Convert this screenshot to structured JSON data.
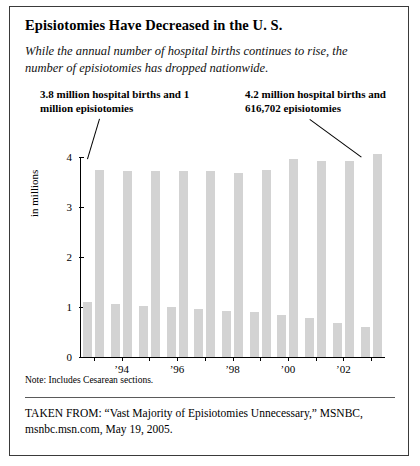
{
  "title": "Episiotomies Have Decreased in the U. S.",
  "subtitle": "While the annual number of hospital births continues to rise, the number of episiotomies has dropped nationwide.",
  "annotation_left": "3.8 million hospital births and 1 million episiotomies",
  "annotation_right": "4.2 million hospital births and 616,702 episiotomies",
  "note": "Note: Includes Cesarean sections.",
  "source": "TAKEN FROM: “Vast Majority of Episiotomies Unnecessary,” MSNBC, msnbc.msn.com, May 19, 2005.",
  "chart_data": {
    "type": "bar",
    "title": "Episiotomies Have Decreased in the U. S.",
    "xlabel": "",
    "ylabel": "in millions",
    "ylim": [
      0,
      4
    ],
    "yticks": [
      "0",
      "1",
      "2",
      "3",
      "4"
    ],
    "grid": false,
    "legend": "none",
    "categories": [
      "1993",
      "1994",
      "1995",
      "1996",
      "1997",
      "1998",
      "1999",
      "2000",
      "2001",
      "2002",
      "2003"
    ],
    "tick_labels": [
      "",
      "’94",
      "",
      "’96",
      "",
      "’98",
      "",
      "’00",
      "",
      "’02",
      ""
    ],
    "series": [
      {
        "name": "hospital births (millions)",
        "values": [
          3.75,
          3.73,
          3.72,
          3.72,
          3.72,
          3.68,
          3.75,
          3.96,
          3.92,
          3.93,
          4.06
        ]
      },
      {
        "name": "episiotomies (millions)",
        "values": [
          1.1,
          1.06,
          1.03,
          1.0,
          0.97,
          0.93,
          0.9,
          0.84,
          0.78,
          0.68,
          0.6
        ]
      }
    ],
    "bar_color": "#d3d3d3"
  }
}
